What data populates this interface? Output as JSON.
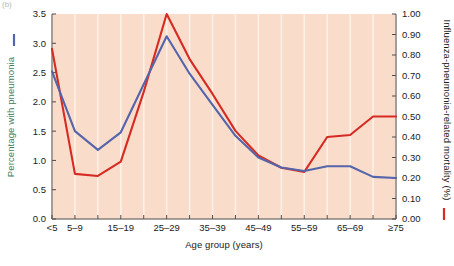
{
  "chart_data": {
    "type": "line",
    "title": "",
    "xlabel": "Age group (years)",
    "categories": [
      "<5",
      "5–9",
      "10–14",
      "15–19",
      "20–24",
      "25–29",
      "30–34",
      "35–39",
      "40–44",
      "45–49",
      "50–54",
      "55–59",
      "60–64",
      "65–69",
      "70–74",
      "≥75"
    ],
    "xtick_labels_shown": [
      "<5",
      "5–9",
      "",
      "15–19",
      "",
      "25–29",
      "",
      "35–39",
      "",
      "45–49",
      "",
      "55–59",
      "",
      "65–69",
      "",
      "≥75"
    ],
    "grid": "vertical-only",
    "legend_position": "axis-labels",
    "plot_background": "#fadccb",
    "series": [
      {
        "name": "Percentage with pneumonia",
        "axis": "left",
        "color": "#5565ab",
        "values": [
          2.52,
          1.5,
          1.18,
          1.48,
          2.3,
          3.12,
          2.48,
          1.95,
          1.42,
          1.05,
          0.88,
          0.82,
          0.9,
          0.9,
          0.72,
          0.7
        ]
      },
      {
        "name": "Influenza-pneumonia-related mortality (%)",
        "axis": "right",
        "color": "#d52b23",
        "values": [
          0.83,
          0.22,
          0.21,
          0.28,
          0.62,
          1.0,
          0.78,
          0.61,
          0.43,
          0.31,
          0.25,
          0.23,
          0.4,
          0.41,
          0.5,
          0.5
        ]
      }
    ],
    "left_axis": {
      "label": "Percentage with pneumonia",
      "label_color": "#3f7d5e",
      "marker_color": "#5565ab",
      "ticks": [
        "0.0",
        "0.5",
        "1.0",
        "1.5",
        "2.0",
        "2.5",
        "3.0",
        "3.5"
      ],
      "min": 0.0,
      "max": 3.5
    },
    "right_axis": {
      "label": "Influenza-pneumonia-related mortality (%)",
      "label_color": "#1a1a1a",
      "marker_color": "#d52b23",
      "ticks": [
        "0.00",
        "0.10",
        "0.20",
        "0.30",
        "0.40",
        "0.50",
        "0.60",
        "0.70",
        "0.80",
        "0.90",
        "1.00"
      ],
      "min": 0.0,
      "max": 1.0
    },
    "corner_label": "(b)"
  }
}
